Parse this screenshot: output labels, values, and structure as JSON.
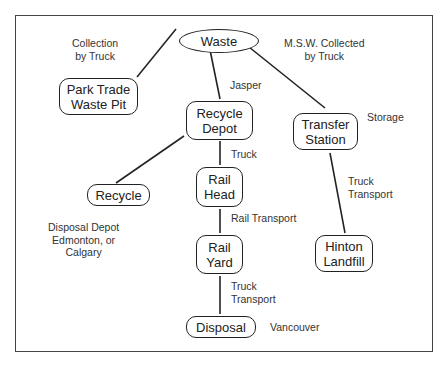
{
  "diagram": {
    "nodes": {
      "waste": {
        "lines": [
          "Waste"
        ]
      },
      "park_trade": {
        "lines": [
          "Park Trade",
          "Waste Pit"
        ]
      },
      "recycle_depot": {
        "lines": [
          "Recycle",
          "Depot"
        ]
      },
      "transfer_station": {
        "lines": [
          "Transfer",
          "Station"
        ]
      },
      "recycle": {
        "lines": [
          "Recycle"
        ]
      },
      "rail_head": {
        "lines": [
          "Rail",
          "Head"
        ]
      },
      "rail_yard": {
        "lines": [
          "Rail",
          "Yard"
        ]
      },
      "hinton_landfill": {
        "lines": [
          "Hinton",
          "Landfill"
        ]
      },
      "disposal": {
        "lines": [
          "Disposal"
        ]
      }
    },
    "labels": {
      "collection_by_truck": [
        "Collection",
        "by Truck"
      ],
      "msw_collected": [
        "M.S.W. Collected",
        "by Truck"
      ],
      "jasper": [
        "Jasper"
      ],
      "storage": [
        "Storage"
      ],
      "truck": [
        "Truck"
      ],
      "truck_transport_right": [
        "Truck",
        "Transport"
      ],
      "rail_transport": [
        "Rail Transport"
      ],
      "disposal_depot": [
        "Disposal Depot",
        "Edmonton, or",
        "Calgary"
      ],
      "truck_transport_bottom": [
        "Truck",
        "Transport"
      ],
      "vancouver": [
        "Vancouver"
      ]
    },
    "edges": [
      {
        "from": "waste",
        "to": "park_trade"
      },
      {
        "from": "waste",
        "to": "recycle_depot"
      },
      {
        "from": "waste",
        "to": "transfer_station"
      },
      {
        "from": "recycle_depot",
        "to": "recycle"
      },
      {
        "from": "recycle_depot",
        "to": "rail_head"
      },
      {
        "from": "rail_head",
        "to": "rail_yard"
      },
      {
        "from": "rail_yard",
        "to": "disposal"
      },
      {
        "from": "transfer_station",
        "to": "hinton_landfill"
      }
    ]
  }
}
